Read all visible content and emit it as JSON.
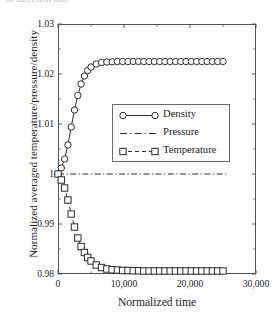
{
  "figure": {
    "top_fragment": "of direction and"
  },
  "chart_data": {
    "type": "line",
    "title": "",
    "xlabel": "Normalized time",
    "ylabel": "Normalized averaged temperature/pressure/density",
    "xlim": [
      0,
      30000
    ],
    "ylim": [
      0.98,
      1.03
    ],
    "xticks": [
      0,
      10000,
      20000,
      30000
    ],
    "xtick_labels": [
      "0",
      "10,000",
      "20,000",
      "30,000"
    ],
    "yticks": [
      0.98,
      0.99,
      1.0,
      1.01,
      1.02,
      1.03
    ],
    "ytick_labels": [
      "0.98",
      "0.99",
      "1",
      "1.01",
      "1.02",
      "1.03"
    ],
    "grid": false,
    "legend_position": "center",
    "series": [
      {
        "name": "Density",
        "marker": "circle",
        "line_style": "solid",
        "color": "#2b2b2b",
        "x": [
          0,
          500,
          1000,
          1500,
          2000,
          2500,
          3000,
          3500,
          4000,
          4500,
          5000,
          5800,
          6600,
          7400,
          8200,
          9000,
          9800,
          10600,
          11400,
          12200,
          13000,
          13800,
          14600,
          15400,
          16200,
          17000,
          17800,
          18600,
          19400,
          20200,
          21000,
          21800,
          22600,
          23400,
          24200,
          25000
        ],
        "y": [
          1.0,
          1.0012,
          1.003,
          1.0058,
          1.0094,
          1.0128,
          1.0157,
          1.018,
          1.0196,
          1.0207,
          1.0214,
          1.022,
          1.0223,
          1.0224,
          1.02245,
          1.0225,
          1.0225,
          1.0225,
          1.0225,
          1.0225,
          1.0225,
          1.0225,
          1.0225,
          1.0225,
          1.0225,
          1.0225,
          1.0225,
          1.0225,
          1.0225,
          1.0225,
          1.0225,
          1.0225,
          1.0225,
          1.0225,
          1.0225,
          1.0225
        ]
      },
      {
        "name": "Pressure",
        "marker": "none",
        "line_style": "dashdot",
        "color": "#2b2b2b",
        "x": [
          0,
          25500
        ],
        "y": [
          1.0,
          1.0
        ]
      },
      {
        "name": "Temperature",
        "marker": "square",
        "line_style": "dashed",
        "color": "#2b2b2b",
        "x": [
          0,
          500,
          1000,
          1500,
          2000,
          2500,
          3000,
          3500,
          4000,
          4500,
          5000,
          5800,
          6600,
          7400,
          8200,
          9000,
          9800,
          10600,
          11400,
          12200,
          13000,
          13800,
          14600,
          15400,
          16200,
          17000,
          17800,
          18600,
          19400,
          20200,
          21000,
          21800,
          22600,
          23400,
          24200,
          25000
        ],
        "y": [
          1.0,
          0.9988,
          0.9972,
          0.9948,
          0.992,
          0.9894,
          0.9872,
          0.9855,
          0.9843,
          0.9833,
          0.9826,
          0.9818,
          0.9813,
          0.981,
          0.98085,
          0.9808,
          0.9807,
          0.9807,
          0.98065,
          0.98065,
          0.9806,
          0.9806,
          0.9806,
          0.9806,
          0.9806,
          0.9806,
          0.9806,
          0.9806,
          0.9806,
          0.9806,
          0.9806,
          0.9806,
          0.9806,
          0.9806,
          0.9806,
          0.9806
        ]
      }
    ],
    "legend": [
      "Density",
      "Pressure",
      "Temperature"
    ]
  }
}
